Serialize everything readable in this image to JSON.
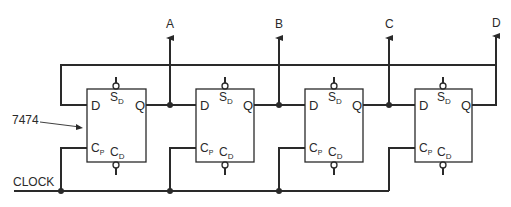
{
  "diagram": {
    "chip_label": "7474",
    "clock_label": "CLOCK",
    "outputs": [
      {
        "label": "A"
      },
      {
        "label": "B"
      },
      {
        "label": "C"
      },
      {
        "label": "D"
      }
    ],
    "flip_flops": [
      {
        "d": "D",
        "q": "Q",
        "sd": "S",
        "sd_sub": "D",
        "cp": "C",
        "cp_sub": "P",
        "cd": "C",
        "cd_sub": "D"
      },
      {
        "d": "D",
        "q": "Q",
        "sd": "S",
        "sd_sub": "D",
        "cp": "C",
        "cp_sub": "P",
        "cd": "C",
        "cd_sub": "D"
      },
      {
        "d": "D",
        "q": "Q",
        "sd": "S",
        "sd_sub": "D",
        "cp": "C",
        "cp_sub": "P",
        "cd": "C",
        "cd_sub": "D"
      },
      {
        "d": "D",
        "q": "Q",
        "sd": "S",
        "sd_sub": "D",
        "cp": "C",
        "cp_sub": "P",
        "cd": "C",
        "cd_sub": "D"
      }
    ],
    "colors": {
      "line": "#2a2a2a",
      "background": "#ffffff"
    }
  }
}
